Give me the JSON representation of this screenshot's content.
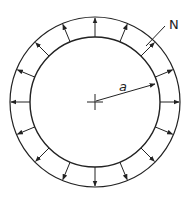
{
  "diagram": {
    "labels": {
      "load": "N",
      "radius": "a"
    },
    "geometry": {
      "center": [
        95,
        102
      ],
      "outer_radius": 85,
      "inner_radius": 65,
      "arrow_count": 16,
      "arrow_start_angle_deg": -90
    },
    "colors": {
      "stroke": "#222222",
      "background": "#ffffff"
    }
  }
}
